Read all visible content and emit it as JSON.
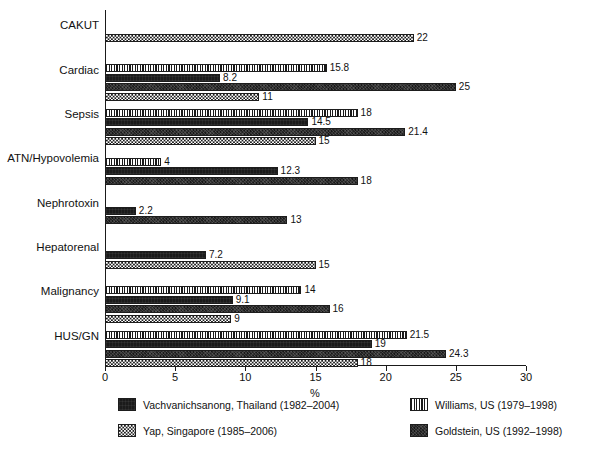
{
  "chart_data": {
    "type": "bar",
    "orientation": "horizontal",
    "title": "",
    "subtitle": "",
    "xlabel": "%",
    "ylabel": "",
    "xlim": [
      0,
      30
    ],
    "xticks": [
      0,
      5,
      10,
      15,
      20,
      25,
      30
    ],
    "xtick_labels": [
      "0",
      "5",
      "10",
      "15",
      "20",
      "25",
      "30"
    ],
    "grid": false,
    "legend_position": "bottom",
    "categories": [
      "CAKUT",
      "Cardiac",
      "Sepsis",
      "ATN/Hypovolemia",
      "Nephrotoxin",
      "Hepatorenal",
      "Malignancy",
      "HUS/GN"
    ],
    "series": [
      {
        "name": "Williams, US (1979–1998)",
        "pattern": "vertical-stripes",
        "values": [
          null,
          15.8,
          18,
          4,
          null,
          null,
          14,
          21.5
        ],
        "labels": [
          "",
          "15.8",
          "18",
          "4",
          "",
          "",
          "14",
          "21.5"
        ]
      },
      {
        "name": "Vachvanichsanong, Thailand (1982–2004)",
        "pattern": "solid-black",
        "values": [
          null,
          8.2,
          14.5,
          12.3,
          2.2,
          7.2,
          9.1,
          19
        ],
        "labels": [
          "",
          "8.2",
          "14.5",
          "12.3",
          "2.2",
          "7.2",
          "9.1",
          "19"
        ]
      },
      {
        "name": "Goldstein, US (1992–1998)",
        "pattern": "dark-texture",
        "values": [
          null,
          25,
          21.4,
          18,
          13,
          null,
          16,
          24.3
        ],
        "labels": [
          "",
          "25",
          "21.4",
          "18",
          "13",
          "",
          "16",
          "24.3"
        ]
      },
      {
        "name": "Yap, Singapore (1985–2006)",
        "pattern": "checkerboard",
        "values": [
          22,
          11,
          15,
          null,
          null,
          15,
          9,
          18
        ],
        "labels": [
          "22",
          "11",
          "15",
          "",
          "",
          "15",
          "9",
          "18"
        ]
      }
    ]
  },
  "axis": {
    "x_title": "%",
    "tick_labels": [
      "0",
      "5",
      "10",
      "15",
      "20",
      "25",
      "30"
    ],
    "category_labels": [
      "CAKUT",
      "Cardiac",
      "Sepsis",
      "ATN/Hypovolemia",
      "Nephrotoxin",
      "Hepatorenal",
      "Malignancy",
      "HUS/GN"
    ]
  },
  "legend": {
    "items": [
      {
        "label": "Vachvanichsanong, Thailand (1982–2004)",
        "pattern": "solid-black"
      },
      {
        "label": "Yap, Singapore (1985–2006)",
        "pattern": "checkerboard"
      },
      {
        "label": "Williams, US (1979–1998)",
        "pattern": "vertical-stripes"
      },
      {
        "label": "Goldstein, US (1992–1998)",
        "pattern": "dark-texture"
      }
    ]
  },
  "colors": {
    "ink": "#1b1b1b",
    "background": "#ffffff"
  }
}
